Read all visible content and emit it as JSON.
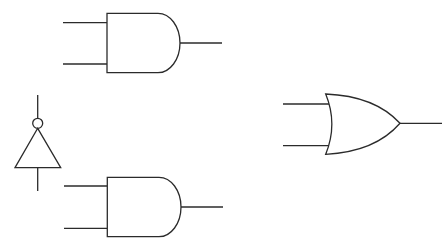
{
  "diagram": {
    "title": "",
    "background": "#ffffff",
    "stroke_color": "#2b2b2b",
    "gates": [
      {
        "id": "and-gate-top",
        "type": "AND",
        "inputs": 2,
        "outputs": 1
      },
      {
        "id": "not-gate",
        "type": "NOT",
        "inputs": 1,
        "outputs": 1,
        "orientation": "up"
      },
      {
        "id": "or-gate",
        "type": "OR",
        "inputs": 2,
        "outputs": 1
      },
      {
        "id": "and-gate-bottom",
        "type": "AND",
        "inputs": 2,
        "outputs": 1
      }
    ],
    "labels": []
  }
}
